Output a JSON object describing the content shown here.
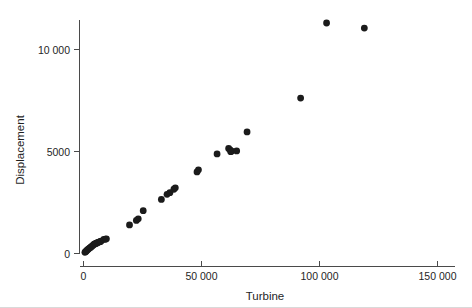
{
  "chart_data": {
    "type": "scatter",
    "title": "",
    "xlabel": "Turbine",
    "ylabel": "Displacement",
    "xlim": [
      0,
      155000
    ],
    "ylim": [
      0,
      11800
    ],
    "grid": false,
    "legend": "none",
    "x_ticks": [
      0,
      50000,
      100000,
      150000
    ],
    "x_tick_labels": [
      "0",
      "50 000",
      "100 000",
      "150 000"
    ],
    "y_ticks": [
      0,
      5000,
      10000
    ],
    "y_tick_labels": [
      "0",
      "5000",
      "10 000"
    ],
    "marker": {
      "shape": "circle",
      "color": "#1b1b1b",
      "size_px": 3.4
    },
    "series": [
      {
        "name": "ships",
        "points": [
          [
            600,
            60
          ],
          [
            900,
            90
          ],
          [
            1200,
            120
          ],
          [
            1500,
            160
          ],
          [
            1900,
            200
          ],
          [
            2300,
            240
          ],
          [
            2700,
            280
          ],
          [
            3100,
            310
          ],
          [
            3500,
            350
          ],
          [
            3900,
            390
          ],
          [
            4300,
            430
          ],
          [
            4700,
            470
          ],
          [
            5100,
            480
          ],
          [
            5400,
            500
          ],
          [
            5700,
            520
          ],
          [
            6100,
            540
          ],
          [
            6500,
            560
          ],
          [
            7000,
            580
          ],
          [
            7400,
            600
          ],
          [
            8600,
            690
          ],
          [
            9300,
            700
          ],
          [
            9700,
            720
          ],
          [
            19500,
            1400
          ],
          [
            22400,
            1620
          ],
          [
            23200,
            1700
          ],
          [
            25300,
            2100
          ],
          [
            33000,
            2650
          ],
          [
            35400,
            2900
          ],
          [
            36600,
            2980
          ],
          [
            38300,
            3150
          ],
          [
            38900,
            3220
          ],
          [
            48100,
            4000
          ],
          [
            48700,
            4100
          ],
          [
            56600,
            4880
          ],
          [
            61500,
            5150
          ],
          [
            62100,
            5080
          ],
          [
            62400,
            4990
          ],
          [
            62800,
            5020
          ],
          [
            64900,
            5030
          ],
          [
            69300,
            5960
          ],
          [
            92000,
            7620
          ],
          [
            103000,
            11300
          ],
          [
            119000,
            11050
          ]
        ]
      }
    ]
  },
  "axis": {
    "y_label": "Displacement",
    "x_label": "Turbine"
  }
}
